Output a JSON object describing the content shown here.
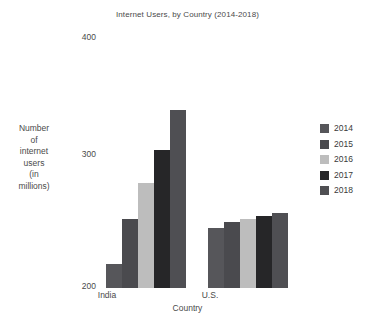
{
  "chart_data": {
    "type": "bar",
    "title": "Internet Users, by Country (2014-2018)",
    "xlabel": "Country",
    "ylabel": "Number of internet users (in millions)",
    "ylabel_lines": [
      "Number",
      "of",
      "internet",
      "users",
      "(in",
      "millions)"
    ],
    "categories": [
      "India",
      "U.S."
    ],
    "series": [
      {
        "name": "2014",
        "values": [
          219,
          247
        ],
        "color": "#56565a"
      },
      {
        "name": "2015",
        "values": [
          254,
          252
        ],
        "color": "#4a4a4e"
      },
      {
        "name": "2016",
        "values": [
          283,
          254
        ],
        "color": "#bdbdbd"
      },
      {
        "name": "2017",
        "values": [
          309,
          257
        ],
        "color": "#262628"
      },
      {
        "name": "2018",
        "values": [
          340,
          259
        ],
        "color": "#4f4f53"
      }
    ],
    "ylim": [
      200,
      400
    ],
    "yticks": [
      400,
      300,
      200
    ],
    "ytick_labels": [
      "400",
      "300",
      "200"
    ],
    "grid": false,
    "legend_position": "right"
  }
}
